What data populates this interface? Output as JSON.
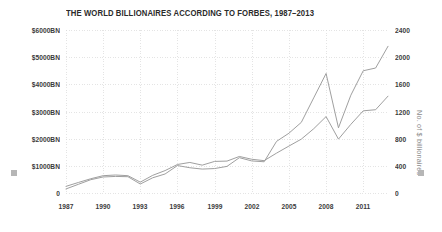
{
  "chart_data": {
    "type": "line",
    "title": "THE WORLD BILLIONAIRES ACCORDING TO FORBES, 1987–2013",
    "xlabel": "",
    "ylabel": "Total wealth of billionaires",
    "y2label": "No. of $ billionaires",
    "grid": true,
    "grid_style": "dotted",
    "legend": "none",
    "xlim": [
      1987,
      2013
    ],
    "ylim": [
      0,
      6000
    ],
    "y2lim": [
      0,
      2400
    ],
    "xticks": [
      "1987",
      "1990",
      "1993",
      "1996",
      "1999",
      "2002",
      "2005",
      "2008",
      "2011"
    ],
    "xtick_values": [
      1987,
      1990,
      1993,
      1996,
      1999,
      2002,
      2005,
      2008,
      2011
    ],
    "yticks": [
      "0",
      "$1000BN",
      "$2000BN",
      "$3000BN",
      "$4000BN",
      "$5000BN",
      "$6000BN"
    ],
    "ytick_values": [
      0,
      1000,
      2000,
      3000,
      4000,
      5000,
      6000
    ],
    "y2ticks": [
      "0",
      "400",
      "800",
      "1200",
      "1600",
      "2000",
      "2400"
    ],
    "y2tick_values": [
      0,
      400,
      800,
      1200,
      1600,
      2000,
      2400
    ],
    "x": [
      1987,
      1988,
      1989,
      1990,
      1991,
      1992,
      1993,
      1994,
      1995,
      1996,
      1997,
      1998,
      1999,
      2000,
      2001,
      2002,
      2003,
      2004,
      2005,
      2006,
      2007,
      2008,
      2009,
      2010,
      2011,
      2012,
      2013
    ],
    "series": [
      {
        "name": "No. of $ billionaires",
        "axis": "right",
        "color": "#9a9a9a",
        "values": [
          98,
          155,
          210,
          255,
          265,
          255,
          160,
          260,
          330,
          420,
          450,
          410,
          465,
          470,
          538,
          497,
          476,
          587,
          691,
          793,
          946,
          1125,
          793,
          1011,
          1210,
          1226,
          1426
        ]
      },
      {
        "name": "Total wealth of billionaires",
        "axis": "left",
        "color": "#9a9a9a",
        "values": [
          150,
          320,
          490,
          590,
          610,
          600,
          330,
          560,
          700,
          1010,
          930,
          880,
          900,
          980,
          1300,
          1180,
          1150,
          1900,
          2200,
          2600,
          3500,
          4400,
          2400,
          3600,
          4500,
          4600,
          5400
        ]
      }
    ],
    "annotations": []
  },
  "style": {
    "background": "#ffffff",
    "page_background": "#f0f0f0",
    "grid_color": "#d8d8d8",
    "line_color": "#9a9a9a",
    "tick_color": "#3a3a3a",
    "axis_title_color": "#8d8d8d",
    "swatch_color": "#b6b6b6"
  },
  "icons": {
    "left_axis_swatch": "square-swatch-icon",
    "right_axis_swatch": "square-swatch-icon"
  }
}
